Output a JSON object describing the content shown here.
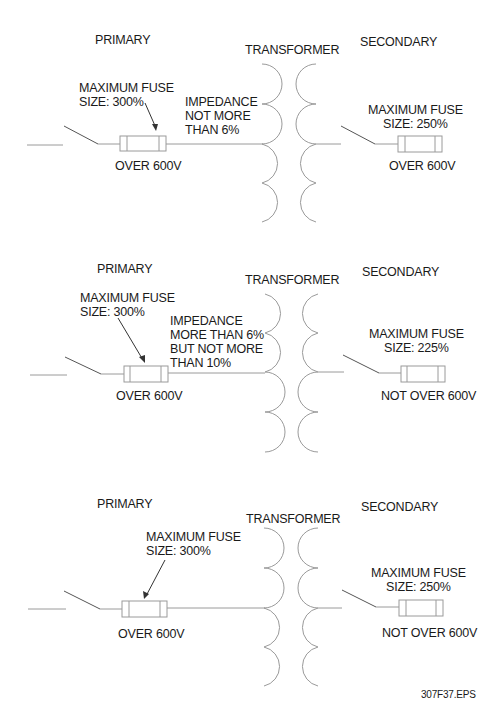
{
  "figure_id": "307F37.EPS",
  "diagrams": [
    {
      "primary_label": "PRIMARY",
      "transformer_label": "TRANSFORMER",
      "secondary_label": "SECONDARY",
      "primary_fuse": [
        "MAXIMUM FUSE",
        "SIZE: 300%"
      ],
      "primary_voltage": "OVER 600V",
      "impedance": [
        "IMPEDANCE",
        "NOT MORE",
        "THAN 6%"
      ],
      "secondary_fuse": [
        "MAXIMUM FUSE",
        "SIZE: 250%"
      ],
      "secondary_voltage": "OVER 600V"
    },
    {
      "primary_label": "PRIMARY",
      "transformer_label": "TRANSFORMER",
      "secondary_label": "SECONDARY",
      "primary_fuse": [
        "MAXIMUM FUSE",
        "SIZE: 300%"
      ],
      "primary_voltage": "OVER 600V",
      "impedance": [
        "IMPEDANCE",
        "MORE THAN 6%",
        "BUT NOT MORE",
        "THAN 10%"
      ],
      "secondary_fuse": [
        "MAXIMUM FUSE",
        "SIZE: 225%"
      ],
      "secondary_voltage": "NOT OVER 600V"
    },
    {
      "primary_label": "PRIMARY",
      "transformer_label": "TRANSFORMER",
      "secondary_label": "SECONDARY",
      "primary_fuse": [
        "MAXIMUM FUSE",
        "SIZE: 300%"
      ],
      "primary_voltage": "OVER 600V",
      "secondary_fuse": [
        "MAXIMUM FUSE",
        "SIZE: 250%"
      ],
      "secondary_voltage": "NOT OVER 600V"
    }
  ]
}
